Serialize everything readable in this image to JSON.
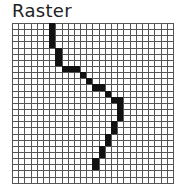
{
  "title": "Raster",
  "grid": {
    "columns": 26,
    "rows": 26,
    "fill_color": "#111111",
    "line_color": "#555555",
    "filled_cells": [
      [
        6,
        0
      ],
      [
        6,
        1
      ],
      [
        6,
        2
      ],
      [
        6,
        3
      ],
      [
        7,
        4
      ],
      [
        7,
        5
      ],
      [
        7,
        6
      ],
      [
        8,
        7
      ],
      [
        9,
        7
      ],
      [
        10,
        7
      ],
      [
        11,
        8
      ],
      [
        12,
        9
      ],
      [
        13,
        10
      ],
      [
        14,
        10
      ],
      [
        15,
        11
      ],
      [
        16,
        12
      ],
      [
        17,
        12
      ],
      [
        17,
        13
      ],
      [
        17,
        14
      ],
      [
        17,
        15
      ],
      [
        16,
        16
      ],
      [
        16,
        17
      ],
      [
        15,
        18
      ],
      [
        15,
        19
      ],
      [
        14,
        20
      ],
      [
        14,
        21
      ],
      [
        13,
        22
      ],
      [
        13,
        23
      ]
    ]
  }
}
